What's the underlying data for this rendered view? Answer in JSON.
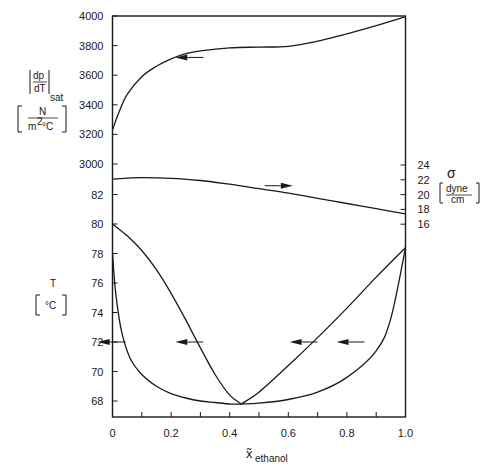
{
  "chart_data": {
    "type": "line",
    "title": "",
    "xlabel": "x̃ethanol",
    "x_ticks": [
      "0",
      "0.2",
      "0.4",
      "0.6",
      "0.8",
      "1.0"
    ],
    "xlim": [
      0,
      1
    ],
    "grid": false,
    "panels": [
      {
        "name": "saturation pressure slope",
        "ylabel": "|dp/dT|sat",
        "yunit": "N / m² °C",
        "axis": "left",
        "y_ticks": [
          "4000",
          "3800",
          "3600",
          "3400",
          "3200",
          "3000"
        ],
        "ylim": [
          3000,
          4000
        ],
        "series": [
          {
            "name": "|dp/dT|sat",
            "x": [
              0,
              0.02,
              0.05,
              0.1,
              0.15,
              0.2,
              0.25,
              0.3,
              0.4,
              0.5,
              0.6,
              0.7,
              0.8,
              0.9,
              1.0
            ],
            "y": [
              3230,
              3340,
              3470,
              3590,
              3660,
              3710,
              3745,
              3765,
              3785,
              3790,
              3795,
              3830,
              3880,
              3935,
              3995
            ]
          }
        ],
        "annotations": [
          {
            "type": "arrow",
            "direction": "left",
            "at": [
              0.1,
              3720
            ],
            "meaning": "read on left axis"
          }
        ]
      },
      {
        "name": "surface tension",
        "ylabel": "σ",
        "yunit": "dyne / cm",
        "axis": "right",
        "y_ticks": [
          "24",
          "22",
          "20",
          "18",
          "16"
        ],
        "ylim": [
          15,
          25
        ],
        "series": [
          {
            "name": "σ",
            "x": [
              0,
              0.1,
              0.2,
              0.3,
              0.4,
              0.5,
              0.6,
              0.7,
              0.8,
              0.9,
              1.0
            ],
            "y": [
              22.1,
              22.3,
              22.2,
              21.9,
              21.4,
              20.8,
              20.2,
              19.5,
              18.8,
              18.1,
              17.4
            ]
          }
        ],
        "annotations": [
          {
            "type": "arrow",
            "direction": "right",
            "at": [
              0.6,
              21.0
            ],
            "meaning": "read on right axis"
          }
        ]
      },
      {
        "name": "boiling temperature (T-x-y diagram)",
        "ylabel": "T",
        "yunit": "°C",
        "axis": "left",
        "y_ticks": [
          "82",
          "80",
          "78",
          "76",
          "74",
          "72",
          "70",
          "68"
        ],
        "ylim": [
          67,
          83
        ],
        "series": [
          {
            "name": "dew line (left branch)",
            "x": [
              0,
              0.05,
              0.1,
              0.15,
              0.2,
              0.25,
              0.3,
              0.35,
              0.4,
              0.44
            ],
            "y": [
              80.0,
              79.2,
              78.2,
              76.9,
              75.3,
              73.5,
              71.6,
              69.8,
              68.4,
              67.8
            ]
          },
          {
            "name": "bubble line (left branch)",
            "x": [
              0,
              0.01,
              0.03,
              0.06,
              0.1,
              0.15,
              0.2,
              0.25,
              0.3,
              0.35,
              0.4,
              0.44
            ],
            "y": [
              78.0,
              75.5,
              72.8,
              70.9,
              69.8,
              69.0,
              68.5,
              68.2,
              68.0,
              67.9,
              67.8,
              67.8
            ]
          },
          {
            "name": "dew line (right branch)",
            "x": [
              0.44,
              0.5,
              0.6,
              0.7,
              0.8,
              0.9,
              1.0
            ],
            "y": [
              67.8,
              68.6,
              70.4,
              72.3,
              74.3,
              76.4,
              78.4
            ]
          },
          {
            "name": "bubble line (right branch)",
            "x": [
              0.44,
              0.5,
              0.6,
              0.7,
              0.8,
              0.9,
              0.95,
              1.0
            ],
            "y": [
              67.8,
              67.85,
              68.1,
              68.6,
              69.6,
              71.4,
              73.6,
              78.4
            ]
          }
        ],
        "annotations": [
          {
            "type": "arrow",
            "direction": "left",
            "at": [
              0.02,
              72.0
            ]
          },
          {
            "type": "arrow",
            "direction": "left",
            "at": [
              0.25,
              72.0
            ]
          },
          {
            "type": "arrow",
            "direction": "left",
            "at": [
              0.67,
              72.0
            ]
          },
          {
            "type": "arrow",
            "direction": "left",
            "at": [
              0.83,
              72.0
            ]
          }
        ],
        "azeotrope": {
          "x": 0.44,
          "T": 67.8
        }
      }
    ]
  },
  "labels": {
    "left_top_title": "dp",
    "left_top_den": "dT",
    "left_top_sub": "sat",
    "left_top_unit_num": "N",
    "left_top_unit_den": "m",
    "left_top_unit_sup": "2",
    "left_top_unit_tail": " °C",
    "left_bottom_title": "T",
    "left_bottom_unit": "°C",
    "right_title": "σ",
    "right_unit_num": "dyne",
    "right_unit_den": "cm",
    "x_title_main": "x̃",
    "x_title_sub": "ethanol"
  }
}
